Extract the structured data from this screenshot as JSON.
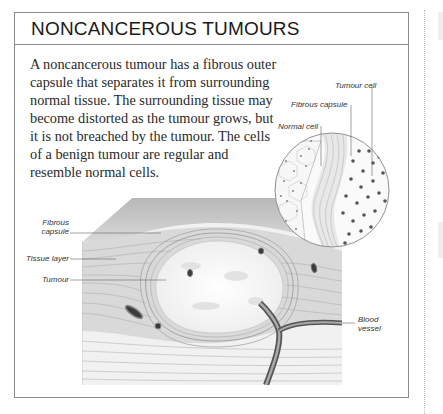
{
  "panel": {
    "title": "NONCANCEROUS TUMOURS",
    "body_lines": [
      "A noncancerous tumour has a fibrous outer",
      "capsule that separates it from surrounding",
      "normal tissue. The surrounding tissue may",
      "become distorted as the tumour grows, but",
      "it is not breached by the tumour. The cells",
      "of a benign tumour are regular and",
      "resemble normal cells."
    ]
  },
  "illustration": {
    "description": "Cross-section of tissue block with encapsulated benign tumour and magnified cell detail",
    "magnified_labels": {
      "tumour_cell": "Tumour cell",
      "fibrous_capsule": "Fibrous capsule",
      "normal_cell": "Normal cell"
    },
    "block_labels": {
      "fibrous_capsule_line1": "Fibrous",
      "fibrous_capsule_line2": "capsule",
      "tissue_layer": "Tissue layer",
      "tumour": "Tumour",
      "blood_vessel_line1": "Blood",
      "blood_vessel_line2": "vessel"
    }
  },
  "colors": {
    "frame_border": "#8a8a8a",
    "title_text": "#1a1a1a",
    "body_text": "#2a2a2a"
  }
}
